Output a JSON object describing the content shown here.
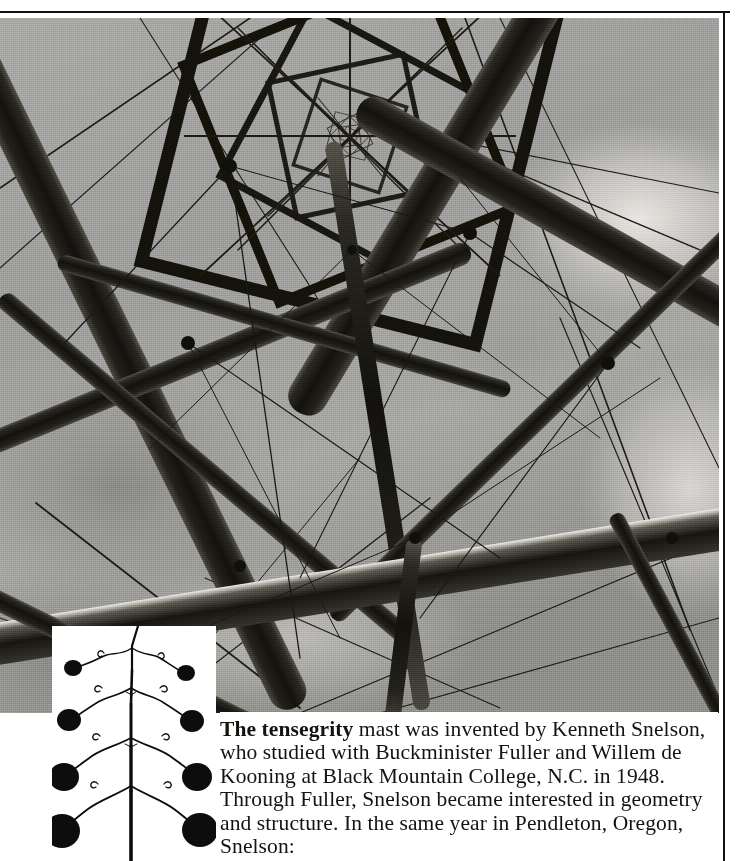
{
  "page": {
    "kind": "printed-book-page",
    "background_color": "#ffffff",
    "rule_color": "#111111"
  },
  "photograph": {
    "name": "tensegrity-mast-photograph",
    "subject": "Tensegrity mast photographed looking upward from below",
    "description": "Black and white photograph of a tensegrity mast seen from directly beneath, showing nested square modules of tubular struts and thin tension cables receding toward a vanishing point against a cloudy sky.",
    "tone": "black-and-white halftone",
    "sky_color": "#9d9d9d",
    "strut_color": "#17150f",
    "cable_color": "#1a1a1a",
    "highlight_color": "#f2f1ec"
  },
  "inset": {
    "name": "mobile-sculpture-diagram",
    "description": "Line diagram of a branching mobile with weighted discs of increasing size hanging from forked arms",
    "background_color": "#ffffff",
    "ink_color": "#0d0d0d",
    "levels": 4,
    "disc_sizes": [
      9,
      13,
      17,
      21
    ]
  },
  "caption": {
    "name": "tensegrity-caption",
    "lead_bold": "The tensegrity",
    "lines": [
      "The tensegrity mast was invented by Kenneth",
      "Snelson, who studied with Buckminister Fuller",
      "and Willem de Kooning at Black Mountain",
      "College, N.C. in 1948. Through Fuller, Snelson",
      "became interested in geometry and structure. In",
      "the same year in Pendleton, Oregon, Snelson:"
    ],
    "body_rest": " mast was invented by Kenneth Snelson, who studied with Buckminister Fuller and Willem de Kooning at Black Mountain College, N.C. in 1948. Through Fuller, Snelson became interested in geometry and structure. In the same year in Pendleton, Oregon, Snelson:",
    "text_color": "#15130f"
  }
}
